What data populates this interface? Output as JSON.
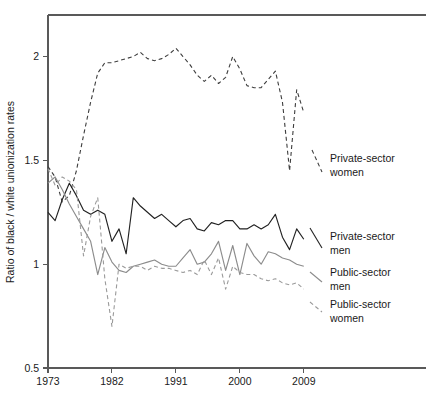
{
  "chart_data": {
    "type": "line",
    "title": "",
    "xlabel": "",
    "ylabel": "Ratio of black / white unionization rates",
    "xlim": [
      1973,
      2011
    ],
    "ylim": [
      0.5,
      2.2
    ],
    "xticks": [
      1973,
      1982,
      1991,
      2000,
      2009
    ],
    "xticklabels": [
      "1973",
      "1982",
      "1991",
      "2000",
      "2009"
    ],
    "yticks": [
      0.5,
      1,
      1.5,
      2
    ],
    "yticklabels": [
      "0.5",
      "1",
      "1.5",
      "2"
    ],
    "grid": false,
    "legend_position": "right-inline",
    "x": [
      1973,
      1974,
      1975,
      1976,
      1977,
      1978,
      1979,
      1980,
      1981,
      1982,
      1983,
      1984,
      1985,
      1986,
      1987,
      1988,
      1989,
      1990,
      1991,
      1992,
      1993,
      1994,
      1995,
      1996,
      1997,
      1998,
      1999,
      2000,
      2001,
      2002,
      2003,
      2004,
      2005,
      2006,
      2007,
      2008,
      2009
    ],
    "series": [
      {
        "name": "Private-sector women",
        "color": "#3d3d3d",
        "style": "dashed",
        "values": [
          1.47,
          1.42,
          1.3,
          1.33,
          1.45,
          1.62,
          1.78,
          1.92,
          1.97,
          1.97,
          1.98,
          1.99,
          2.0,
          2.02,
          1.99,
          1.98,
          1.99,
          2.01,
          2.04,
          2.0,
          1.96,
          1.91,
          1.88,
          1.91,
          1.87,
          1.9,
          2.0,
          1.94,
          1.86,
          1.85,
          1.85,
          1.89,
          1.93,
          1.78,
          1.45,
          1.84,
          1.73
        ]
      },
      {
        "name": "Private-sector men",
        "color": "#222222",
        "style": "solid",
        "values": [
          1.25,
          1.21,
          1.31,
          1.39,
          1.33,
          1.26,
          1.24,
          1.26,
          1.24,
          1.11,
          1.17,
          1.05,
          1.32,
          1.28,
          1.25,
          1.22,
          1.24,
          1.21,
          1.18,
          1.21,
          1.22,
          1.17,
          1.16,
          1.2,
          1.19,
          1.21,
          1.21,
          1.17,
          1.17,
          1.19,
          1.17,
          1.19,
          1.24,
          1.13,
          1.07,
          1.17,
          1.12
        ]
      },
      {
        "name": "Public-sector men",
        "color": "#8c8c8c",
        "style": "solid",
        "values": [
          1.39,
          1.42,
          1.36,
          1.29,
          1.23,
          1.17,
          1.11,
          0.95,
          1.08,
          1.01,
          0.97,
          0.96,
          0.99,
          1.0,
          1.01,
          1.02,
          1.0,
          0.99,
          0.99,
          1.03,
          1.07,
          1.0,
          1.01,
          1.05,
          1.11,
          0.97,
          1.09,
          0.95,
          1.1,
          1.04,
          1.0,
          1.06,
          1.05,
          1.03,
          1.02,
          1.0,
          0.99
        ]
      },
      {
        "name": "Public-sector women",
        "color": "#9a9a9a",
        "style": "dashed",
        "values": [
          1.46,
          1.38,
          1.42,
          1.4,
          1.36,
          1.04,
          1.23,
          1.32,
          0.93,
          0.7,
          1.0,
          0.98,
          0.99,
          0.99,
          0.97,
          0.99,
          0.98,
          0.98,
          0.97,
          0.96,
          0.97,
          0.95,
          1.02,
          0.95,
          1.03,
          0.88,
          0.99,
          0.96,
          0.95,
          0.95,
          0.93,
          0.92,
          0.93,
          0.91,
          0.9,
          0.91,
          0.88
        ]
      }
    ],
    "legend_entries": [
      {
        "label_line1": "Private-sector",
        "label_line2": "women"
      },
      {
        "label_line1": "Private-sector",
        "label_line2": "men"
      },
      {
        "label_line1": "Public-sector",
        "label_line2": "men"
      },
      {
        "label_line1": "Public-sector",
        "label_line2": "women"
      }
    ]
  }
}
